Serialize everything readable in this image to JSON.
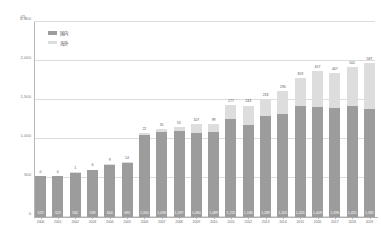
{
  "chart_data": {
    "type": "bar",
    "subtype": "stacked-column",
    "title": "",
    "unit_label": "(円)",
    "xlabel": "",
    "ylabel": "",
    "ylim": [
      0,
      2500
    ],
    "yticks": [
      "0",
      "500",
      "1,000",
      "1,500",
      "2,000",
      "2,500"
    ],
    "ytick_values": [
      0,
      500,
      1000,
      1500,
      2000,
      2500
    ],
    "grid": true,
    "legend_position": "top-left",
    "legend": [
      "国内",
      "海外"
    ],
    "categories": [
      "2000",
      "2001",
      "2002",
      "2003",
      "2004",
      "2005",
      "2006",
      "2007",
      "2008",
      "2009",
      "2010",
      "2011",
      "2012",
      "2013",
      "2014",
      "2015",
      "2016",
      "2017",
      "2018",
      "2019"
    ],
    "series": [
      {
        "name": "国内",
        "color": "#9c9c9c",
        "values": [
          529,
          523,
          562,
          598,
          664,
          694,
          1050,
          1093,
          1097,
          1080,
          1089,
          1255,
          1186,
          1289,
          1325,
          1420,
          1409,
          1396,
          1420,
          1382
        ]
      },
      {
        "name": "海外",
        "color": "#dddddd",
        "values": [
          0,
          0,
          1,
          6,
          9,
          14,
          22,
          31,
          55,
          107,
          99,
          177,
          243,
          218,
          290,
          359,
          457,
          447,
          501,
          587
        ]
      }
    ],
    "totals": [
      529,
      523,
      563,
      604,
      673,
      708,
      1072,
      1124,
      1152,
      1187,
      1188,
      1432,
      1429,
      1507,
      1615,
      1779,
      1866,
      1843,
      1921,
      1969
    ],
    "domestic_labels": [
      "529",
      "523",
      "562",
      "598",
      "664",
      "694",
      "1,050",
      "1,093",
      "1,097",
      "1,080",
      "1,089",
      "1,255",
      "1,186",
      "1,289",
      "1,325",
      "1,420",
      "1,409",
      "1,396",
      "1,420",
      "1,382"
    ],
    "overseas_labels": [
      "0",
      "0",
      "1",
      "6",
      "9",
      "14",
      "22",
      "31",
      "55",
      "107",
      "99",
      "177",
      "243",
      "218",
      "290",
      "359",
      "457",
      "447",
      "501",
      "587",
      "611"
    ]
  },
  "legend": {
    "domestic": "国内",
    "overseas": "海外"
  }
}
